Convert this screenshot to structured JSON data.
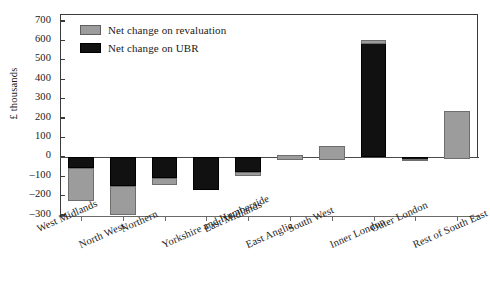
{
  "chart_data": {
    "type": "bar",
    "stacked": true,
    "title": "",
    "xlabel": "",
    "ylabel": "£ thousands",
    "ylim": [
      -300,
      700
    ],
    "yticks": [
      700,
      600,
      500,
      400,
      300,
      200,
      100,
      0,
      -100,
      -200,
      -300
    ],
    "ytick_labels": [
      "700",
      "600",
      "500",
      "400",
      "300",
      "200",
      "100",
      "0",
      "-100",
      "-200",
      "-300"
    ],
    "grid": false,
    "legend_position": "top-left",
    "categories": [
      "West Midlands",
      "North West",
      "Northern",
      "Yorkshire and Humberside",
      "East Midlands",
      "East Anglia",
      "South West",
      "Inner London",
      "Outer London",
      "Rest of South East"
    ],
    "series": [
      {
        "name": "Net change on revaluation",
        "color": "#9c9c9c",
        "values": [
          -168,
          -150,
          -35,
          0,
          -20,
          22,
          70,
          -20,
          10,
          250
        ]
      },
      {
        "name": "Net change on UBR",
        "color": "#111111",
        "values": [
          -60,
          -150,
          -110,
          -172,
          -80,
          -15,
          -15,
          600,
          -22,
          -12
        ]
      }
    ]
  },
  "legend": {
    "items": [
      {
        "label": "Net change on revaluation",
        "swatch": "gray-swatch"
      },
      {
        "label": "Net change on UBR",
        "swatch": "black-swatch"
      }
    ]
  },
  "axis": {
    "y_title": "£ thousands"
  }
}
